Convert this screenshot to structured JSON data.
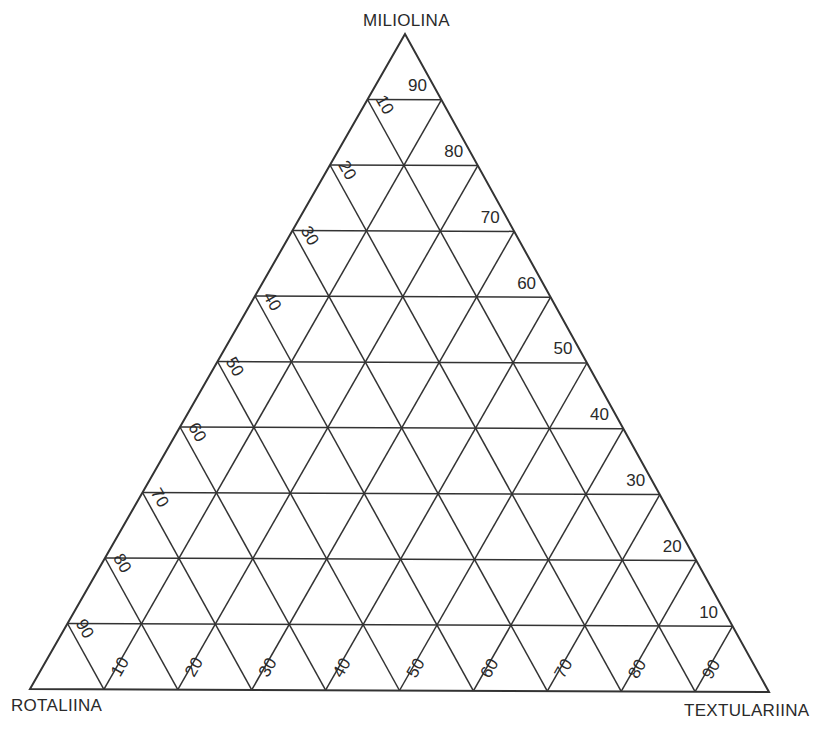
{
  "diagram": {
    "type": "ternary",
    "vertices": {
      "top": "MILIOLINA",
      "bottom_left": "ROTALIINA",
      "bottom_right": "TEXTULARIINA"
    },
    "grid_step_percent": 10,
    "axes": {
      "miliolina_labels_right_edge": [
        "90",
        "80",
        "70",
        "60",
        "50",
        "40",
        "30",
        "20",
        "10"
      ],
      "rotaliina_labels_left_edge": [
        "10",
        "20",
        "30",
        "40",
        "50",
        "60",
        "70",
        "80",
        "90"
      ],
      "textulariina_labels_bottom_edge": [
        "10",
        "20",
        "30",
        "40",
        "50",
        "60",
        "70",
        "80",
        "90"
      ]
    },
    "colors": {
      "line": "#333333",
      "text": "#2a2a2a",
      "background": "#ffffff"
    }
  }
}
